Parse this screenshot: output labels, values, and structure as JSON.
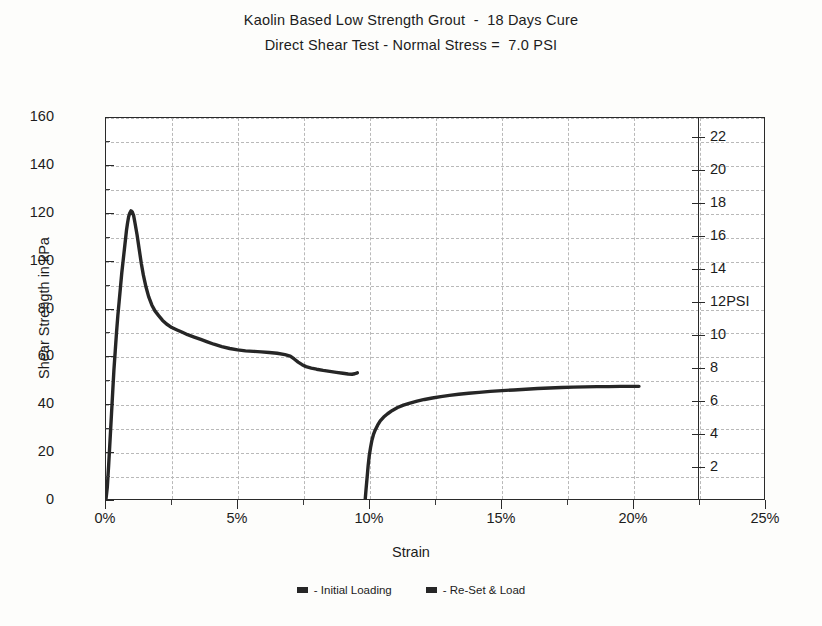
{
  "title": {
    "line1": "Kaolin Based Low Strength Grout  -  18 Days Cure",
    "line2": "Direct Shear Test - Normal Stress =  7.0 PSI"
  },
  "axes": {
    "y_label": "Shear Strength in kPa",
    "x_label": "Strain",
    "secondary_unit_label": "PSI"
  },
  "legend": {
    "items": [
      {
        "label": "- Initial Loading",
        "color": "#262626"
      },
      {
        "label": "- Re-Set & Load",
        "color": "#262626"
      }
    ]
  },
  "chart_data": {
    "type": "line",
    "xlabel": "Strain",
    "ylabel": "Shear Strength in kPa",
    "y2label": "PSI",
    "xlim": [
      0,
      25
    ],
    "ylim": [
      0,
      160
    ],
    "y2lim": [
      0,
      23.2
    ],
    "x_unit": "%",
    "xticks": [
      0,
      5,
      10,
      15,
      20,
      25
    ],
    "xticklabels": [
      "0%",
      "5%",
      "10%",
      "15%",
      "20%",
      "25%"
    ],
    "x_minor_ticks": [
      2.5,
      7.5,
      12.5,
      17.5,
      22.5
    ],
    "yticks": [
      0,
      20,
      40,
      60,
      80,
      100,
      120,
      140,
      160
    ],
    "yticklabels": [
      "0",
      "20",
      "40",
      "60",
      "80",
      "100",
      "120",
      "140",
      "160"
    ],
    "y_minor_ticks": [
      10,
      30,
      50,
      70,
      90,
      110,
      130,
      150
    ],
    "y2ticks": [
      2,
      4,
      6,
      8,
      10,
      12,
      14,
      16,
      18,
      20,
      22
    ],
    "y2ticklabels": [
      "2",
      "4",
      "6",
      "8",
      "10",
      "12PSI",
      "14",
      "16",
      "18",
      "20",
      "22"
    ],
    "grid": true,
    "grid_style": "dashed",
    "legend_position": "below",
    "peak_strength_kpa": 121,
    "peak_strain_pct": 0.95,
    "residual_strength_kpa": 52,
    "reset_plateau_kpa": 47,
    "series": [
      {
        "name": "- Initial Loading",
        "color": "#262626",
        "points": [
          [
            0.0,
            0.0
          ],
          [
            0.05,
            5.0
          ],
          [
            0.1,
            14.0
          ],
          [
            0.14,
            22.0
          ],
          [
            0.18,
            30.0
          ],
          [
            0.22,
            38.0
          ],
          [
            0.26,
            46.0
          ],
          [
            0.3,
            54.0
          ],
          [
            0.35,
            62.0
          ],
          [
            0.4,
            70.0
          ],
          [
            0.45,
            77.0
          ],
          [
            0.5,
            83.0
          ],
          [
            0.55,
            89.0
          ],
          [
            0.6,
            95.0
          ],
          [
            0.65,
            100.0
          ],
          [
            0.7,
            105.0
          ],
          [
            0.74,
            109.0
          ],
          [
            0.78,
            113.0
          ],
          [
            0.82,
            116.0
          ],
          [
            0.86,
            118.5
          ],
          [
            0.9,
            120.0
          ],
          [
            0.95,
            121.0
          ],
          [
            1.0,
            120.5
          ],
          [
            1.05,
            119.0
          ],
          [
            1.1,
            116.0
          ],
          [
            1.18,
            111.0
          ],
          [
            1.26,
            105.0
          ],
          [
            1.34,
            99.0
          ],
          [
            1.42,
            94.0
          ],
          [
            1.52,
            89.0
          ],
          [
            1.62,
            85.0
          ],
          [
            1.74,
            81.5
          ],
          [
            1.86,
            79.0
          ],
          [
            2.0,
            77.0
          ],
          [
            2.15,
            75.0
          ],
          [
            2.3,
            73.5
          ],
          [
            2.5,
            72.0
          ],
          [
            2.7,
            71.0
          ],
          [
            2.9,
            70.0
          ],
          [
            3.1,
            69.0
          ],
          [
            3.35,
            68.0
          ],
          [
            3.6,
            67.0
          ],
          [
            3.85,
            66.0
          ],
          [
            4.1,
            65.0
          ],
          [
            4.4,
            64.0
          ],
          [
            4.7,
            63.2
          ],
          [
            5.0,
            62.6
          ],
          [
            5.3,
            62.2
          ],
          [
            5.6,
            62.0
          ],
          [
            5.9,
            61.8
          ],
          [
            6.2,
            61.5
          ],
          [
            6.5,
            61.2
          ],
          [
            6.8,
            60.6
          ],
          [
            7.0,
            60.0
          ],
          [
            7.15,
            58.8
          ],
          [
            7.3,
            57.5
          ],
          [
            7.45,
            56.4
          ],
          [
            7.6,
            55.6
          ],
          [
            7.8,
            55.0
          ],
          [
            8.0,
            54.5
          ],
          [
            8.25,
            54.0
          ],
          [
            8.5,
            53.6
          ],
          [
            8.75,
            53.2
          ],
          [
            9.0,
            52.8
          ],
          [
            9.2,
            52.5
          ],
          [
            9.35,
            52.4
          ],
          [
            9.45,
            52.6
          ],
          [
            9.55,
            53.0
          ]
        ]
      },
      {
        "name": "- Re-Set & Load",
        "color": "#262626",
        "points": [
          [
            9.85,
            0.0
          ],
          [
            9.88,
            4.0
          ],
          [
            9.92,
            9.0
          ],
          [
            9.96,
            14.0
          ],
          [
            10.0,
            18.0
          ],
          [
            10.05,
            21.5
          ],
          [
            10.1,
            24.5
          ],
          [
            10.16,
            27.0
          ],
          [
            10.23,
            29.0
          ],
          [
            10.32,
            31.0
          ],
          [
            10.42,
            32.8
          ],
          [
            10.55,
            34.4
          ],
          [
            10.7,
            35.8
          ],
          [
            10.88,
            37.2
          ],
          [
            11.08,
            38.4
          ],
          [
            11.3,
            39.4
          ],
          [
            11.55,
            40.3
          ],
          [
            11.82,
            41.1
          ],
          [
            12.1,
            41.8
          ],
          [
            12.4,
            42.4
          ],
          [
            12.72,
            43.0
          ],
          [
            13.05,
            43.5
          ],
          [
            13.4,
            44.0
          ],
          [
            13.78,
            44.4
          ],
          [
            14.18,
            44.8
          ],
          [
            14.6,
            45.2
          ],
          [
            15.05,
            45.5
          ],
          [
            15.5,
            45.8
          ],
          [
            15.95,
            46.1
          ],
          [
            16.4,
            46.4
          ],
          [
            16.85,
            46.6
          ],
          [
            17.3,
            46.8
          ],
          [
            17.75,
            47.0
          ],
          [
            18.2,
            47.1
          ],
          [
            18.65,
            47.2
          ],
          [
            19.1,
            47.2
          ],
          [
            19.55,
            47.3
          ],
          [
            20.0,
            47.3
          ],
          [
            20.25,
            47.3
          ]
        ]
      }
    ]
  }
}
